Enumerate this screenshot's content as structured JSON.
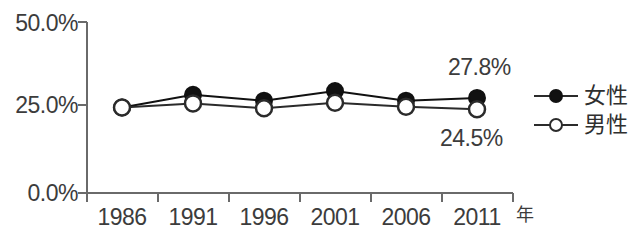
{
  "chart_data": {
    "type": "line",
    "title": "",
    "xlabel": "年",
    "ylabel": "",
    "categories": [
      "1986",
      "1991",
      "1996",
      "2001",
      "2006",
      "2011"
    ],
    "ylim": [
      0,
      50
    ],
    "yticks": [
      "0.0%",
      "25.0%",
      "50.0%"
    ],
    "ytick_values": [
      0,
      25,
      50
    ],
    "grid": false,
    "legend_position": "right",
    "series": [
      {
        "name": "女性",
        "marker": "filled-circle",
        "color": "#111111",
        "values": [
          25.0,
          28.7,
          27.0,
          29.8,
          27.0,
          27.8
        ]
      },
      {
        "name": "男性",
        "marker": "open-circle",
        "color": "#2b2b2b",
        "values": [
          25.0,
          26.2,
          24.8,
          26.4,
          25.2,
          24.5
        ]
      }
    ],
    "annotations": [
      {
        "text": "27.8%",
        "series": "女性",
        "category": "2011",
        "position": "above"
      },
      {
        "text": "24.5%",
        "series": "男性",
        "category": "2011",
        "position": "below"
      }
    ]
  },
  "axis": {
    "unit_label": "年"
  },
  "legend": {
    "items": [
      {
        "label": "女性",
        "marker": "filled-circle"
      },
      {
        "label": "男性",
        "marker": "open-circle"
      }
    ]
  },
  "colors": {
    "axis": "#6a6a6a",
    "text": "#3c3c3c",
    "female_marker": "#111111",
    "male_marker": "#2b2b2b",
    "background": "#ffffff"
  }
}
